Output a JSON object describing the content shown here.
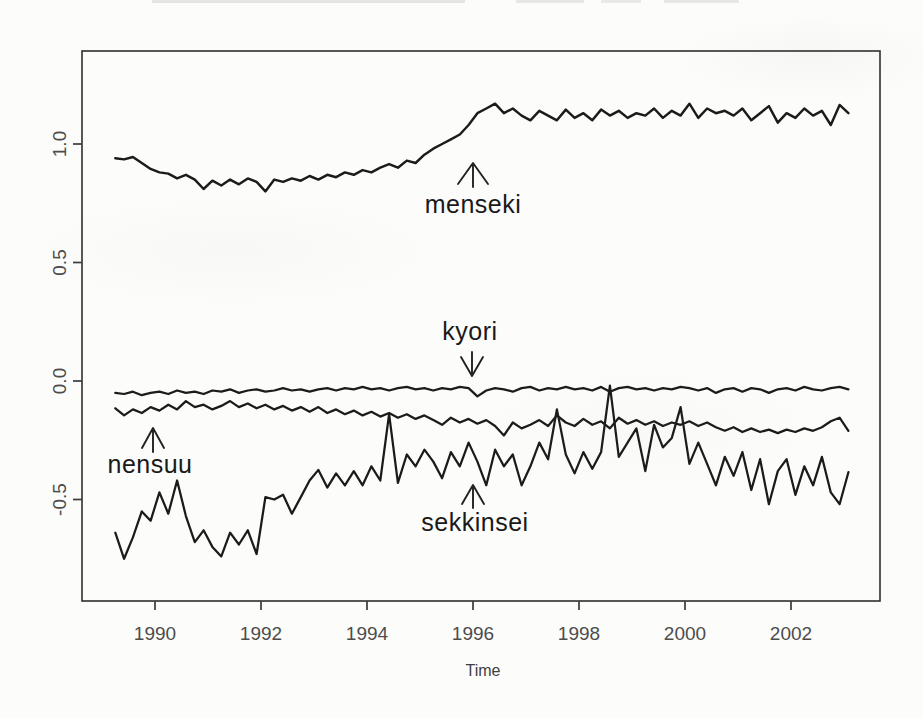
{
  "figure": {
    "background_color": "#fcfcfa",
    "line_color": "#1b1b1b",
    "axis_color": "#3a3a3a",
    "tick_text_color": "#4c4c4c"
  },
  "chart_data": {
    "type": "line",
    "title": "",
    "xlabel": "Time",
    "ylabel": "",
    "grid": false,
    "legend": "none (direct line annotations with arrows)",
    "xlim": [
      1988.6,
      2003.7
    ],
    "ylim": [
      -0.93,
      1.39
    ],
    "x_ticks": [
      1990,
      1992,
      1994,
      1996,
      1998,
      2000,
      2002
    ],
    "y_ticks": [
      "1.0",
      "0.5",
      "0.0",
      "-0.5"
    ],
    "y_tick_values": [
      1.0,
      0.5,
      0.0,
      -0.5
    ],
    "x_start": 1989.25,
    "x_step": 0.1666667,
    "n_points": 84,
    "series": [
      {
        "name": "menseki",
        "values": [
          0.94,
          0.935,
          0.945,
          0.92,
          0.895,
          0.88,
          0.875,
          0.855,
          0.87,
          0.85,
          0.81,
          0.845,
          0.825,
          0.85,
          0.83,
          0.855,
          0.84,
          0.8,
          0.85,
          0.84,
          0.855,
          0.845,
          0.865,
          0.85,
          0.87,
          0.86,
          0.88,
          0.87,
          0.89,
          0.88,
          0.9,
          0.915,
          0.9,
          0.93,
          0.92,
          0.955,
          0.98,
          1.0,
          1.02,
          1.04,
          1.08,
          1.13,
          1.15,
          1.17,
          1.13,
          1.15,
          1.12,
          1.1,
          1.14,
          1.12,
          1.1,
          1.145,
          1.11,
          1.13,
          1.1,
          1.145,
          1.12,
          1.14,
          1.11,
          1.13,
          1.12,
          1.15,
          1.11,
          1.14,
          1.12,
          1.17,
          1.11,
          1.15,
          1.13,
          1.14,
          1.12,
          1.15,
          1.1,
          1.13,
          1.16,
          1.09,
          1.13,
          1.11,
          1.15,
          1.12,
          1.14,
          1.08,
          1.165,
          1.13
        ]
      },
      {
        "name": "kyori",
        "values": [
          -0.05,
          -0.055,
          -0.045,
          -0.06,
          -0.05,
          -0.045,
          -0.055,
          -0.04,
          -0.05,
          -0.045,
          -0.055,
          -0.04,
          -0.045,
          -0.035,
          -0.05,
          -0.04,
          -0.035,
          -0.045,
          -0.04,
          -0.03,
          -0.04,
          -0.035,
          -0.045,
          -0.035,
          -0.03,
          -0.04,
          -0.03,
          -0.035,
          -0.025,
          -0.035,
          -0.03,
          -0.04,
          -0.03,
          -0.025,
          -0.035,
          -0.03,
          -0.04,
          -0.03,
          -0.035,
          -0.025,
          -0.03,
          -0.065,
          -0.04,
          -0.03,
          -0.035,
          -0.045,
          -0.03,
          -0.025,
          -0.04,
          -0.03,
          -0.035,
          -0.025,
          -0.035,
          -0.03,
          -0.04,
          -0.025,
          -0.045,
          -0.03,
          -0.025,
          -0.035,
          -0.03,
          -0.04,
          -0.03,
          -0.035,
          -0.025,
          -0.03,
          -0.04,
          -0.03,
          -0.05,
          -0.035,
          -0.03,
          -0.045,
          -0.03,
          -0.035,
          -0.05,
          -0.035,
          -0.03,
          -0.04,
          -0.025,
          -0.035,
          -0.04,
          -0.03,
          -0.025,
          -0.035
        ]
      },
      {
        "name": "nensuu",
        "values": [
          -0.115,
          -0.145,
          -0.12,
          -0.135,
          -0.11,
          -0.125,
          -0.1,
          -0.12,
          -0.085,
          -0.11,
          -0.1,
          -0.12,
          -0.105,
          -0.085,
          -0.11,
          -0.095,
          -0.115,
          -0.1,
          -0.12,
          -0.105,
          -0.125,
          -0.11,
          -0.13,
          -0.11,
          -0.135,
          -0.12,
          -0.14,
          -0.125,
          -0.145,
          -0.13,
          -0.15,
          -0.135,
          -0.155,
          -0.14,
          -0.16,
          -0.145,
          -0.165,
          -0.185,
          -0.155,
          -0.175,
          -0.16,
          -0.18,
          -0.165,
          -0.19,
          -0.23,
          -0.175,
          -0.2,
          -0.185,
          -0.165,
          -0.19,
          -0.145,
          -0.175,
          -0.19,
          -0.16,
          -0.185,
          -0.17,
          -0.2,
          -0.155,
          -0.18,
          -0.165,
          -0.185,
          -0.17,
          -0.19,
          -0.175,
          -0.185,
          -0.17,
          -0.19,
          -0.175,
          -0.195,
          -0.21,
          -0.195,
          -0.215,
          -0.2,
          -0.215,
          -0.205,
          -0.22,
          -0.205,
          -0.215,
          -0.2,
          -0.21,
          -0.195,
          -0.17,
          -0.155,
          -0.21
        ]
      },
      {
        "name": "sekkinsei",
        "values": [
          -0.64,
          -0.75,
          -0.66,
          -0.55,
          -0.59,
          -0.47,
          -0.56,
          -0.42,
          -0.57,
          -0.68,
          -0.63,
          -0.7,
          -0.74,
          -0.64,
          -0.69,
          -0.63,
          -0.73,
          -0.49,
          -0.5,
          -0.48,
          -0.56,
          -0.49,
          -0.42,
          -0.375,
          -0.45,
          -0.39,
          -0.44,
          -0.38,
          -0.44,
          -0.36,
          -0.42,
          -0.14,
          -0.43,
          -0.31,
          -0.36,
          -0.29,
          -0.34,
          -0.41,
          -0.3,
          -0.36,
          -0.26,
          -0.34,
          -0.44,
          -0.29,
          -0.36,
          -0.31,
          -0.44,
          -0.36,
          -0.26,
          -0.33,
          -0.12,
          -0.31,
          -0.39,
          -0.3,
          -0.37,
          -0.3,
          -0.02,
          -0.32,
          -0.26,
          -0.2,
          -0.38,
          -0.185,
          -0.28,
          -0.24,
          -0.11,
          -0.35,
          -0.26,
          -0.35,
          -0.44,
          -0.32,
          -0.4,
          -0.3,
          -0.46,
          -0.33,
          -0.52,
          -0.38,
          -0.33,
          -0.48,
          -0.36,
          -0.44,
          -0.32,
          -0.47,
          -0.52,
          -0.385
        ]
      }
    ],
    "annotations": [
      {
        "label": "menseki",
        "arrow_direction": "up",
        "arrow_points_to": "menseki series near x=1996"
      },
      {
        "label": "kyori",
        "arrow_direction": "down",
        "arrow_points_to": "kyori series near x=1996"
      },
      {
        "label": "nensuu",
        "arrow_direction": "up",
        "arrow_points_to": "nensuu series near x=1990"
      },
      {
        "label": "sekkinsei",
        "arrow_direction": "up",
        "arrow_points_to": "sekkinsei series near x=1996"
      }
    ]
  }
}
